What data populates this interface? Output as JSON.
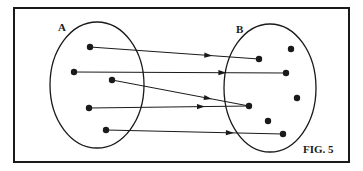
{
  "figure": {
    "caption": "FIG. 5",
    "frame": {
      "x": 14,
      "y": 8,
      "w": 335,
      "h": 154
    },
    "set_a": {
      "label": "A",
      "ellipse": {
        "cx": 97,
        "cy": 85,
        "rx": 47,
        "ry": 63
      },
      "points": [
        [
          90,
          47
        ],
        [
          74,
          72
        ],
        [
          112,
          80
        ],
        [
          89,
          108
        ],
        [
          106,
          130
        ]
      ]
    },
    "set_b": {
      "label": "B",
      "ellipse": {
        "cx": 270,
        "cy": 88,
        "rx": 46,
        "ry": 64
      },
      "points": [
        [
          259,
          59
        ],
        [
          291,
          49
        ],
        [
          286,
          73
        ],
        [
          297,
          98
        ],
        [
          249,
          106
        ],
        [
          268,
          121
        ],
        [
          283,
          134
        ]
      ]
    },
    "mappings": [
      {
        "from": 0,
        "to": 0
      },
      {
        "from": 1,
        "to": 2
      },
      {
        "from": 2,
        "to": 4
      },
      {
        "from": 3,
        "to": 4
      },
      {
        "from": 4,
        "to": 6
      }
    ],
    "colors": {
      "ink": "#1a1a1a",
      "background": "#ffffff"
    }
  }
}
